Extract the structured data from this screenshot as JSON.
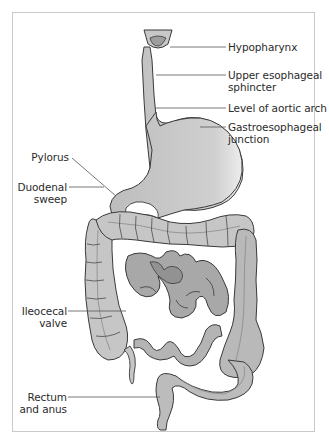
{
  "figure": {
    "colors": {
      "organ_fill": "#c4c4c4",
      "organ_fill_dark": "#a9a9a9",
      "organ_stroke": "#3a3a3a",
      "leader_line": "#555555",
      "frame_border": "#c9c9c9",
      "text": "#2b2b2b"
    },
    "labels_right": [
      {
        "id": "hypopharynx",
        "lines": [
          "Hypopharynx"
        ]
      },
      {
        "id": "upper-esophageal-sphincter",
        "lines": [
          "Upper esophageal",
          "sphincter"
        ]
      },
      {
        "id": "level-of-aortic-arch",
        "lines": [
          "Level of aortic arch"
        ]
      },
      {
        "id": "gastroesophageal-junction",
        "lines": [
          "Gastroesophageal",
          "junction"
        ]
      }
    ],
    "labels_left": [
      {
        "id": "pylorus",
        "lines": [
          "Pylorus"
        ]
      },
      {
        "id": "duodenal-sweep",
        "lines": [
          "Duodenal",
          "sweep"
        ]
      },
      {
        "id": "ileocecal-valve",
        "lines": [
          "Ileocecal",
          "valve"
        ]
      },
      {
        "id": "rectum-and-anus",
        "lines": [
          "Rectum",
          "and anus"
        ]
      }
    ]
  }
}
